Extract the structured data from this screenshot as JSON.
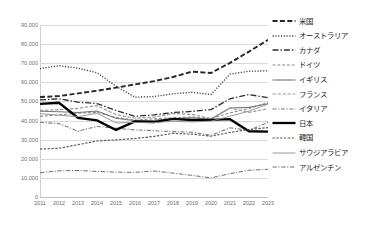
{
  "chart_data": {
    "type": "line",
    "title": "",
    "subtitle": "",
    "xlabel": "",
    "ylabel": "",
    "grid": true,
    "legend_position": "right",
    "xlim": [
      2011,
      2023
    ],
    "ylim": [
      0,
      90000
    ],
    "y_tick_step": 10000,
    "categories": [
      "2011",
      "2012",
      "2013",
      "2014",
      "2015",
      "2016",
      "2017",
      "2018",
      "2019",
      "2020",
      "2021",
      "2022",
      "2023"
    ],
    "x": [
      2011,
      2012,
      2013,
      2014,
      2015,
      2016,
      2017,
      2018,
      2019,
      2020,
      2021,
      2022,
      2023
    ],
    "y_ticks": [
      "0",
      "10,000",
      "20,000",
      "30,000",
      "40,000",
      "50,000",
      "60,000",
      "70,000",
      "80,000",
      "90,000"
    ],
    "y_tick_values": [
      0,
      10000,
      20000,
      30000,
      40000,
      50000,
      60000,
      70000,
      80000,
      90000
    ],
    "series": [
      {
        "name": "米国",
        "style": "dashed",
        "color": "#262626",
        "width": 1.9,
        "dash": "5,2.4",
        "values": [
          52300,
          52800,
          54200,
          55600,
          57200,
          58900,
          60600,
          62800,
          65600,
          64900,
          70200,
          76100,
          82200
        ]
      },
      {
        "name": "オーストラリア",
        "style": "dotted",
        "color": "#3f3f3f",
        "width": 1.3,
        "dash": "1.2,1.6",
        "values": [
          67200,
          68700,
          67400,
          65000,
          58000,
          52200,
          52600,
          54000,
          54800,
          53600,
          64300,
          65800,
          66000
        ]
      },
      {
        "name": "カナダ",
        "style": "dash-dot-long",
        "color": "#2e2e2e",
        "width": 1.3,
        "dash": "6,2,1.4,2",
        "values": [
          50800,
          51400,
          49600,
          48900,
          45300,
          42200,
          43000,
          44200,
          44800,
          45700,
          51400,
          53600,
          52000
        ]
      },
      {
        "name": "ドイツ",
        "style": "fine-dash",
        "color": "#8a8a8a",
        "width": 1.1,
        "dash": "3,1.8",
        "values": [
          42200,
          43000,
          43800,
          44300,
          41600,
          40200,
          40900,
          41500,
          41800,
          41000,
          44000,
          46300,
          49400
        ]
      },
      {
        "name": "イギリス",
        "style": "solid-thin",
        "color": "#767676",
        "width": 1.1,
        "dash": "",
        "values": [
          44900,
          44600,
          44200,
          45000,
          41200,
          39900,
          40100,
          41000,
          41400,
          40700,
          46600,
          46900,
          48800
        ]
      },
      {
        "name": "フランス",
        "style": "dash",
        "color": "#9a9a9a",
        "width": 1.2,
        "dash": "3.4,1.6",
        "values": [
          45300,
          45700,
          46400,
          47800,
          43100,
          41200,
          41800,
          43700,
          43200,
          41000,
          46600,
          44300,
          46200
        ]
      },
      {
        "name": "イタリア",
        "style": "dash-dot",
        "color": "#7d7d7d",
        "width": 1.1,
        "dash": "4,1.6,1.2,1.6",
        "values": [
          39100,
          38400,
          34500,
          36900,
          36000,
          35100,
          34700,
          34200,
          33900,
          32300,
          36200,
          34900,
          39100
        ]
      },
      {
        "name": "日本",
        "style": "solid-thick",
        "color": "#000000",
        "width": 2.3,
        "dash": "",
        "values": [
          48700,
          49300,
          41400,
          40100,
          35100,
          39500,
          39200,
          40900,
          40200,
          40400,
          40700,
          34400,
          34200
        ]
      },
      {
        "name": "韓国",
        "style": "small-dash",
        "color": "#5c5c5c",
        "width": 1.2,
        "dash": "2.4,1.4",
        "values": [
          25100,
          25500,
          27400,
          29300,
          29900,
          30600,
          31700,
          33300,
          32900,
          31800,
          33800,
          35300,
          36300
        ]
      },
      {
        "name": "サウジアラビア",
        "style": "solid-hair",
        "color": "#8f8f8f",
        "width": 0.9,
        "dash": "",
        "values": [
          43600,
          42800,
          42000,
          43900,
          38800,
          39000,
          38900,
          39600,
          39300,
          39700,
          42300,
          44900,
          48600
        ]
      },
      {
        "name": "アルゼンチン",
        "style": "dash-dot-thin",
        "color": "#6e6e6e",
        "width": 1.0,
        "dash": "4.4,1.6,1.1,1.6",
        "values": [
          12700,
          13700,
          13900,
          13400,
          13000,
          12900,
          13600,
          12500,
          11300,
          10000,
          12200,
          14000,
          14500
        ]
      }
    ]
  },
  "legend": {
    "items": [
      {
        "label": "米国"
      },
      {
        "label": "オーストラリア"
      },
      {
        "label": "カナダ"
      },
      {
        "label": "ドイツ"
      },
      {
        "label": "イギリス"
      },
      {
        "label": "フランス"
      },
      {
        "label": "イタリア"
      },
      {
        "label": "日本"
      },
      {
        "label": "韓国"
      },
      {
        "label": "サウジアラビア"
      },
      {
        "label": "アルゼンチン"
      }
    ]
  }
}
